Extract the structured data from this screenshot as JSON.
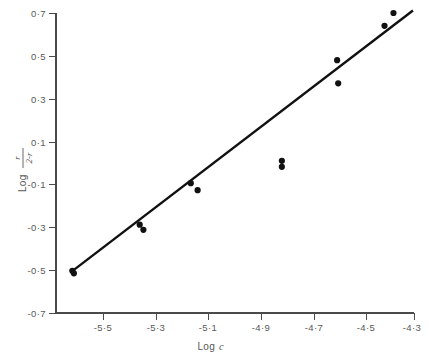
{
  "figure": {
    "background_color": "#ffffff",
    "ink_color": "#111111",
    "axis_color": "#4a4a4a",
    "label_color": "#595959"
  },
  "chart_data": {
    "type": "scatter",
    "title": "",
    "subtitle": "",
    "xlabel": "Log c",
    "xlabel_parts": {
      "prefix": "Log",
      "variable": "c"
    },
    "ylabel": "Log r/(2-r)",
    "ylabel_parts": {
      "prefix": "Log",
      "numerator": "r",
      "denominator": "2-r"
    },
    "xlim": [
      -5.62,
      -4.26
    ],
    "ylim": [
      -0.7,
      0.7
    ],
    "xticks": [
      -5.5,
      -5.3,
      -5.1,
      -4.9,
      -4.7,
      -4.5,
      -4.3
    ],
    "xticklabels": [
      "-5·5",
      "-5·3",
      "-5·1",
      "-4·9",
      "-4·7",
      "-4·5",
      "-4·3"
    ],
    "yticks": [
      0.7,
      0.5,
      0.3,
      0.1,
      -0.1,
      -0.3,
      -0.5,
      -0.7
    ],
    "yticklabels": [
      "0·7",
      "0·5",
      "0·3",
      "0·1",
      "-0·1",
      "-0·3",
      "-0·5",
      "-0·7"
    ],
    "grid": false,
    "legend": false,
    "marker": "filled-circle",
    "marker_radius_px": 3.1,
    "points": [
      {
        "x": -5.558,
        "y": -0.503
      },
      {
        "x": -5.552,
        "y": -0.515
      },
      {
        "x": -5.302,
        "y": -0.288
      },
      {
        "x": -5.288,
        "y": -0.312
      },
      {
        "x": -5.108,
        "y": -0.094
      },
      {
        "x": -5.082,
        "y": -0.127
      },
      {
        "x": -4.762,
        "y": 0.01
      },
      {
        "x": -4.762,
        "y": -0.018
      },
      {
        "x": -4.552,
        "y": 0.48
      },
      {
        "x": -4.548,
        "y": 0.372
      },
      {
        "x": -4.372,
        "y": 0.64
      },
      {
        "x": -4.338,
        "y": 0.7
      }
    ],
    "fit_line": {
      "type": "linear-regression",
      "x_start": -5.562,
      "y_start": -0.508,
      "x_end": -4.264,
      "y_end": 0.712,
      "slope": 0.94,
      "intercept": 4.718
    }
  },
  "axes_geometry": {
    "plot_left_px": 56,
    "plot_right_px": 414,
    "plot_top_px": 13,
    "plot_bottom_px": 313
  }
}
